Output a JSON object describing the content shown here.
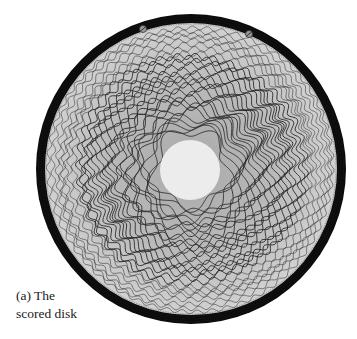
{
  "figure": {
    "caption_line1": "(a) The",
    "caption_line2": "scored disk",
    "disk": {
      "center": [
        191,
        169
      ],
      "outer_radius": 155,
      "rim_width": 9,
      "inner_radius": 30,
      "colors": {
        "rim": "#0b0b0b",
        "disk_outer": "#d2d2d2",
        "disk_mid": "#b9b9b9",
        "disk_inner": "#a9a9a9",
        "center": "#ececec",
        "line": "#2a2a2a"
      },
      "screws": [
        [
          143,
          29
        ],
        [
          249,
          34
        ]
      ],
      "rings": {
        "count": 30,
        "r_start": 38,
        "r_end": 142,
        "wave_min": 5,
        "wave_max": 60,
        "amp_min": 2.0,
        "amp_max": 6.5
      }
    }
  }
}
